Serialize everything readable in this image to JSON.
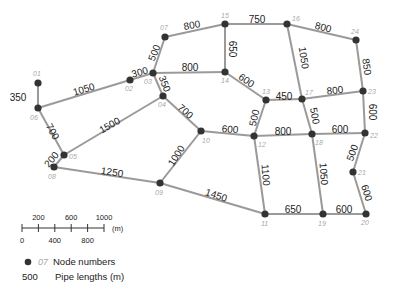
{
  "diagram": {
    "colors": {
      "pipe": "#9a9a9a",
      "node": "#333333",
      "node_label": "#a8a8a8",
      "pipe_label": "#222222"
    },
    "nodes": [
      {
        "id": "01",
        "x": 38,
        "y": 83,
        "lx": 33,
        "ly": 76
      },
      {
        "id": "02",
        "x": 130,
        "y": 80,
        "lx": 125,
        "ly": 91
      },
      {
        "id": "03",
        "x": 153,
        "y": 73,
        "lx": 144,
        "ly": 84
      },
      {
        "id": "04",
        "x": 163,
        "y": 96,
        "lx": 158,
        "ly": 107
      },
      {
        "id": "05",
        "x": 64,
        "y": 155,
        "lx": 69,
        "ly": 159
      },
      {
        "id": "06",
        "x": 38,
        "y": 108,
        "lx": 30,
        "ly": 120
      },
      {
        "id": "07",
        "x": 165,
        "y": 37,
        "lx": 160,
        "ly": 30
      },
      {
        "id": "08",
        "x": 54,
        "y": 167,
        "lx": 48,
        "ly": 179
      },
      {
        "id": "09",
        "x": 160,
        "y": 183,
        "lx": 155,
        "ly": 195
      },
      {
        "id": "10",
        "x": 201,
        "y": 131,
        "lx": 202,
        "ly": 143
      },
      {
        "id": "11",
        "x": 265,
        "y": 214,
        "lx": 261,
        "ly": 226
      },
      {
        "id": "12",
        "x": 254,
        "y": 136,
        "lx": 258,
        "ly": 147
      },
      {
        "id": "13",
        "x": 266,
        "y": 100,
        "lx": 262,
        "ly": 94
      },
      {
        "id": "14",
        "x": 225,
        "y": 72,
        "lx": 221,
        "ly": 83
      },
      {
        "id": "15",
        "x": 225,
        "y": 24,
        "lx": 221,
        "ly": 18
      },
      {
        "id": "16",
        "x": 287,
        "y": 24,
        "lx": 292,
        "ly": 21
      },
      {
        "id": "17",
        "x": 302,
        "y": 99,
        "lx": 305,
        "ly": 95
      },
      {
        "id": "18",
        "x": 312,
        "y": 134,
        "lx": 315,
        "ly": 145
      },
      {
        "id": "19",
        "x": 323,
        "y": 214,
        "lx": 318,
        "ly": 226
      },
      {
        "id": "20",
        "x": 366,
        "y": 214,
        "lx": 361,
        "ly": 225
      },
      {
        "id": "21",
        "x": 353,
        "y": 172,
        "lx": 358,
        "ly": 175
      },
      {
        "id": "22",
        "x": 365,
        "y": 133,
        "lx": 370,
        "ly": 138
      },
      {
        "id": "23",
        "x": 363,
        "y": 91,
        "lx": 368,
        "ly": 94
      },
      {
        "id": "24",
        "x": 356,
        "y": 40,
        "lx": 351,
        "ly": 34
      }
    ],
    "pipes": [
      {
        "from": "01",
        "to": "06",
        "length": "350",
        "lx": 18,
        "ly": 98,
        "rot": 0
      },
      {
        "from": "06",
        "to": "02",
        "length": "1050",
        "lx": 84,
        "ly": 90,
        "rot": -17
      },
      {
        "from": "02",
        "to": "03",
        "length": "300",
        "lx": 140,
        "ly": 73,
        "rot": -15
      },
      {
        "from": "03",
        "to": "07",
        "length": "500",
        "lx": 155,
        "ly": 53,
        "rot": -68
      },
      {
        "from": "07",
        "to": "15",
        "length": "800",
        "lx": 192,
        "ly": 26,
        "rot": -10
      },
      {
        "from": "15",
        "to": "16",
        "length": "750",
        "lx": 257,
        "ly": 20,
        "rot": 0
      },
      {
        "from": "16",
        "to": "24",
        "length": "800",
        "lx": 323,
        "ly": 28,
        "rot": 14
      },
      {
        "from": "03",
        "to": "14",
        "length": "800",
        "lx": 190,
        "ly": 68,
        "rot": 0
      },
      {
        "from": "15",
        "to": "14",
        "length": "650",
        "lx": 232,
        "ly": 49,
        "rot": 90
      },
      {
        "from": "03",
        "to": "04",
        "length": "350",
        "lx": 164,
        "ly": 84,
        "rot": 68
      },
      {
        "from": "16",
        "to": "17",
        "length": "1050",
        "lx": 303,
        "ly": 58,
        "rot": 82
      },
      {
        "from": "24",
        "to": "23",
        "length": "850",
        "lx": 366,
        "ly": 67,
        "rot": 82
      },
      {
        "from": "14",
        "to": "13",
        "length": "600",
        "lx": 246,
        "ly": 81,
        "rot": 35
      },
      {
        "from": "13",
        "to": "17",
        "length": "450",
        "lx": 284,
        "ly": 97,
        "rot": 0
      },
      {
        "from": "17",
        "to": "23",
        "length": "800",
        "lx": 335,
        "ly": 91,
        "rot": -6
      },
      {
        "from": "04",
        "to": "10",
        "length": "700",
        "lx": 185,
        "ly": 112,
        "rot": 42
      },
      {
        "from": "13",
        "to": "12",
        "length": "500",
        "lx": 255,
        "ly": 118,
        "rot": -78
      },
      {
        "from": "17",
        "to": "18",
        "length": "500",
        "lx": 314,
        "ly": 116,
        "rot": 80
      },
      {
        "from": "23",
        "to": "22",
        "length": "600",
        "lx": 372,
        "ly": 112,
        "rot": 90
      },
      {
        "from": "10",
        "to": "12",
        "length": "600",
        "lx": 230,
        "ly": 130,
        "rot": 5
      },
      {
        "from": "12",
        "to": "18",
        "length": "800",
        "lx": 283,
        "ly": 132,
        "rot": 0
      },
      {
        "from": "18",
        "to": "22",
        "length": "600",
        "lx": 340,
        "ly": 130,
        "rot": 0
      },
      {
        "from": "06",
        "to": "05",
        "length": "700",
        "lx": 52,
        "ly": 132,
        "rot": 60
      },
      {
        "from": "04",
        "to": "05",
        "length": "1500",
        "lx": 110,
        "ly": 126,
        "rot": -30
      },
      {
        "from": "05",
        "to": "08",
        "length": "200",
        "lx": 52,
        "ly": 160,
        "rot": -50
      },
      {
        "from": "08",
        "to": "09",
        "length": "1250",
        "lx": 112,
        "ly": 173,
        "rot": 8
      },
      {
        "from": "10",
        "to": "09",
        "length": "1000",
        "lx": 177,
        "ly": 156,
        "rot": -58
      },
      {
        "from": "09",
        "to": "11",
        "length": "1450",
        "lx": 216,
        "ly": 196,
        "rot": 18
      },
      {
        "from": "12",
        "to": "11",
        "length": "1100",
        "lx": 265,
        "ly": 175,
        "rot": 85
      },
      {
        "from": "18",
        "to": "19",
        "length": "1050",
        "lx": 323,
        "ly": 174,
        "rot": 86
      },
      {
        "from": "22",
        "to": "21",
        "length": "500",
        "lx": 353,
        "ly": 153,
        "rot": -70
      },
      {
        "from": "21",
        "to": "20",
        "length": "600",
        "lx": 366,
        "ly": 193,
        "rot": 72
      },
      {
        "from": "11",
        "to": "19",
        "length": "650",
        "lx": 293,
        "ly": 210,
        "rot": 0
      },
      {
        "from": "19",
        "to": "20",
        "length": "600",
        "lx": 344,
        "ly": 210,
        "rot": 0
      }
    ]
  },
  "scale_bar": {
    "top_labels": [
      "200",
      "600",
      "1000"
    ],
    "bottom_labels": [
      "0",
      "400",
      "800"
    ],
    "unit": "(m)"
  },
  "legend": {
    "node_sample": "07",
    "node_text": "Node numbers",
    "pipe_sample": "500",
    "pipe_text": "Pipe lengths (m)"
  }
}
